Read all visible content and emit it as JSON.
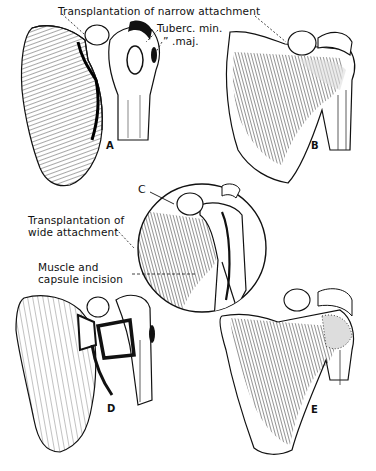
{
  "figure": {
    "type": "anatomical surgical illustration",
    "panels": [
      {
        "id": "A",
        "label": "A"
      },
      {
        "id": "B",
        "label": "B"
      },
      {
        "id": "C",
        "label": "C"
      },
      {
        "id": "D",
        "label": "D"
      },
      {
        "id": "E",
        "label": "E"
      }
    ],
    "annotations": {
      "narrow_attachment": "Transplantation of narrow attachment",
      "tuberc_min": "Tuberc. min.",
      "tuberc_maj": "”  .maj.",
      "wide_attachment_line1": "Transplantation of",
      "wide_attachment_line2": "wide attachment",
      "muscle_incision_line1": "Muscle and",
      "muscle_incision_line2": "capsule incision"
    },
    "colors": {
      "ink": "#111111",
      "paper": "#ffffff"
    }
  }
}
